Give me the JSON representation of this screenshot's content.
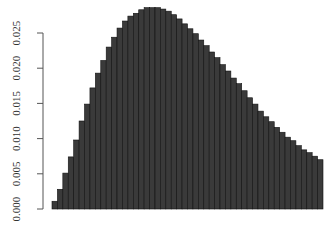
{
  "chart_data": {
    "type": "bar",
    "title": "",
    "xlabel": "",
    "ylabel": "",
    "ylim": [
      0,
      0.03
    ],
    "yticks": [
      0.0,
      0.005,
      0.01,
      0.015,
      0.02,
      0.025
    ],
    "ytick_labels": [
      "0.000",
      "0.005",
      "0.010",
      "0.015",
      "0.020",
      "0.025"
    ],
    "grid": false,
    "legend": null,
    "bar_fill": "#3a3a3a",
    "bar_border": "#111111",
    "values": [
      0.0011,
      0.0028,
      0.0051,
      0.0074,
      0.0098,
      0.0125,
      0.0149,
      0.0172,
      0.0193,
      0.0211,
      0.023,
      0.0244,
      0.0257,
      0.0267,
      0.0274,
      0.0278,
      0.0283,
      0.0286,
      0.0286,
      0.0286,
      0.0284,
      0.0281,
      0.0276,
      0.027,
      0.0263,
      0.0256,
      0.0249,
      0.024,
      0.0232,
      0.0223,
      0.0215,
      0.0205,
      0.0196,
      0.0186,
      0.0178,
      0.0168,
      0.0158,
      0.0149,
      0.0139,
      0.0131,
      0.0124,
      0.0116,
      0.0109,
      0.0102,
      0.0097,
      0.009,
      0.0084,
      0.008,
      0.0075,
      0.007
    ]
  }
}
